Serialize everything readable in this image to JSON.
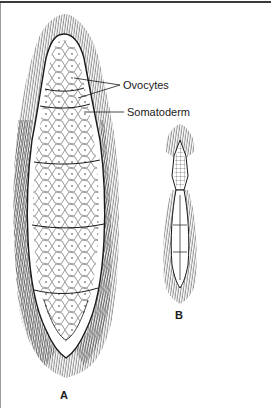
{
  "figure": {
    "labels": {
      "ovocytes": "Ovocytes",
      "somatoderm": "Somatoderm"
    },
    "panels": [
      {
        "id": "A",
        "letter": "A"
      },
      {
        "id": "B",
        "letter": "B"
      }
    ]
  },
  "style": {
    "ink": "#1a1a1a",
    "border_top": "#3a3a3a",
    "border_left": "#9a9a9a",
    "background": "#ffffff"
  }
}
